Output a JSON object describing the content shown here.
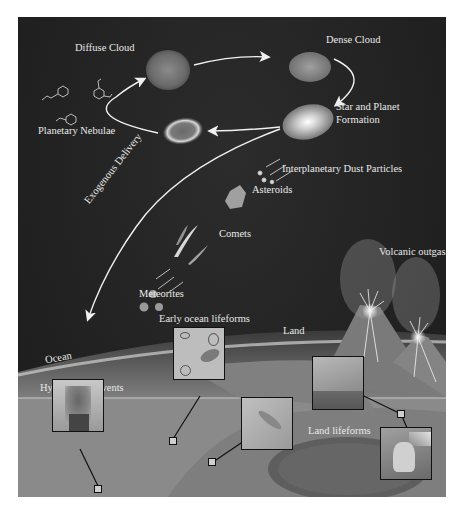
{
  "diagram": {
    "cycle": {
      "stages": [
        {
          "id": "diffuse-cloud",
          "label": "Diffuse Cloud"
        },
        {
          "id": "dense-cloud",
          "label": "Dense Cloud"
        },
        {
          "id": "star-planet-formation",
          "label_line1": "Star and Planet",
          "label_line2": "Formation"
        },
        {
          "id": "planetary-nebulae",
          "label": "Planetary Nebulae"
        }
      ]
    },
    "delivery": {
      "label": "Exogenous Delivery",
      "items": [
        {
          "id": "idp",
          "label": "Interplanetary Dust Particles"
        },
        {
          "id": "asteroids",
          "label": "Asteroids"
        },
        {
          "id": "comets",
          "label": "Comets"
        },
        {
          "id": "meteorites",
          "label": "Meteorites"
        }
      ]
    },
    "earth": {
      "ocean_label": "Ocean",
      "land_label": "Land",
      "volcanic_label": "Volcanic outgassing",
      "hydrothermal_label": "Hydrothermal vents",
      "early_ocean_label": "Early ocean lifeforms",
      "land_lifeforms_label": "Land lifeforms"
    },
    "colors": {
      "space": "#242424",
      "text": "#e8e8e8",
      "arrow": "#f0f0f0",
      "ground": "#8a8a8a",
      "inset_border": "#111111"
    }
  }
}
